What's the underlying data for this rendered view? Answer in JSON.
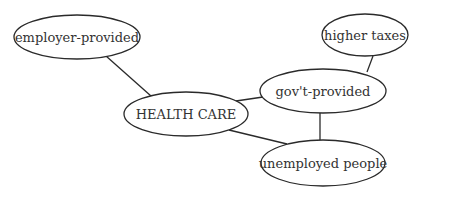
{
  "diagram": {
    "type": "concept-map",
    "nodes": [
      {
        "id": "employer",
        "label": "employer-provided",
        "cx": 77,
        "cy": 37,
        "rx": 63,
        "ry": 22
      },
      {
        "id": "health",
        "label": "HEALTH CARE",
        "cx": 186,
        "cy": 114,
        "rx": 62,
        "ry": 22
      },
      {
        "id": "govt",
        "label": "gov't-provided",
        "cx": 323,
        "cy": 91,
        "rx": 63,
        "ry": 22
      },
      {
        "id": "taxes",
        "label": "higher taxes",
        "cx": 365,
        "cy": 35,
        "rx": 43,
        "ry": 21
      },
      {
        "id": "unemployed",
        "label": "unemployed people",
        "cx": 323,
        "cy": 163,
        "rx": 62,
        "ry": 23
      }
    ],
    "edges": [
      {
        "from": "employer",
        "to": "health"
      },
      {
        "from": "health",
        "to": "govt"
      },
      {
        "from": "govt",
        "to": "taxes"
      },
      {
        "from": "health",
        "to": "unemployed"
      },
      {
        "from": "govt",
        "to": "unemployed"
      }
    ]
  }
}
